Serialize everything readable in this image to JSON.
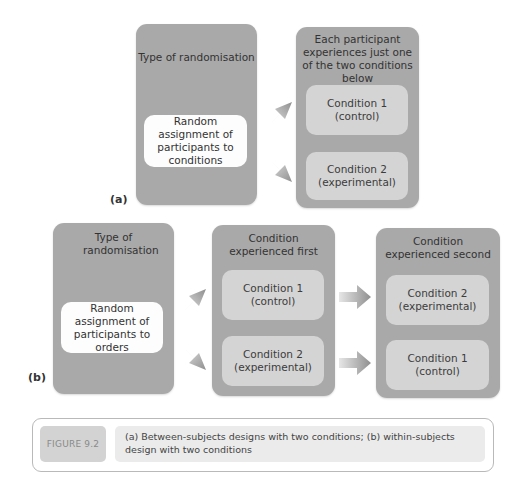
{
  "diagram_a": {
    "label": "(a)",
    "left_panel": {
      "title": "Type of randomisation",
      "box_text": "Random assignment of participants to conditions"
    },
    "right_panel": {
      "title": "Each participant experiences just one of the two conditions below",
      "conditions": [
        {
          "line1": "Condition 1",
          "line2": "(control)"
        },
        {
          "line1": "Condition 2",
          "line2": "(experimental)"
        }
      ]
    }
  },
  "diagram_b": {
    "label": "(b)",
    "left_panel": {
      "title": "Type of randomisation",
      "box_text": "Random assignment of participants to orders"
    },
    "middle_panel": {
      "title": "Condition experienced first",
      "conditions": [
        {
          "line1": "Condition 1",
          "line2": "(control)"
        },
        {
          "line1": "Condition 2",
          "line2": "(experimental)"
        }
      ]
    },
    "right_panel": {
      "title": "Condition experienced second",
      "conditions": [
        {
          "line1": "Condition 2",
          "line2": "(experimental)"
        },
        {
          "line1": "Condition 1",
          "line2": "(control)"
        }
      ]
    }
  },
  "caption": {
    "figure_number": "FIGURE 9.2",
    "text": "(a) Between-subjects designs with two conditions; (b) within-subjects design with two conditions"
  },
  "colors": {
    "panel": "#a9a9a9",
    "inner_grey": "#d4d4d4",
    "inner_white": "#fdfdfd",
    "arrow": "#9a9a9a"
  }
}
